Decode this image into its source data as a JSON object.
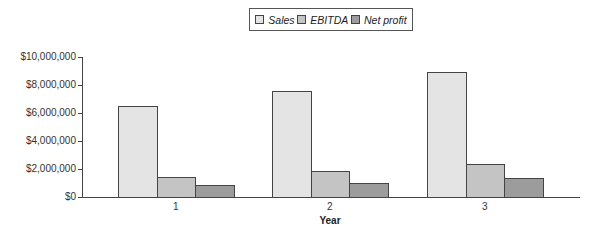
{
  "chart_data": {
    "type": "bar",
    "title": "",
    "xlabel": "Year",
    "ylabel": "",
    "categories": [
      "1",
      "2",
      "3"
    ],
    "series": [
      {
        "name": "Sales",
        "color": "#e4e4e4",
        "values": [
          6500000,
          7600000,
          8900000
        ]
      },
      {
        "name": "EBITDA",
        "color": "#c4c4c4",
        "values": [
          1400000,
          1850000,
          2350000
        ]
      },
      {
        "name": "Net profit",
        "color": "#9c9c9c",
        "values": [
          850000,
          1000000,
          1350000
        ]
      }
    ],
    "ylim": [
      0,
      10000000
    ],
    "yticks": [
      "$0",
      "$2,000,000",
      "$4,000,000",
      "$6,000,000",
      "$8,000,000",
      "$10,000,000"
    ],
    "grid": false,
    "legend_position": "top-center"
  },
  "legend": {
    "items": [
      {
        "label": "Sales",
        "color": "#e4e4e4"
      },
      {
        "label": "EBITDA",
        "color": "#c4c4c4"
      },
      {
        "label": "Net profit",
        "color": "#9c9c9c"
      }
    ]
  }
}
